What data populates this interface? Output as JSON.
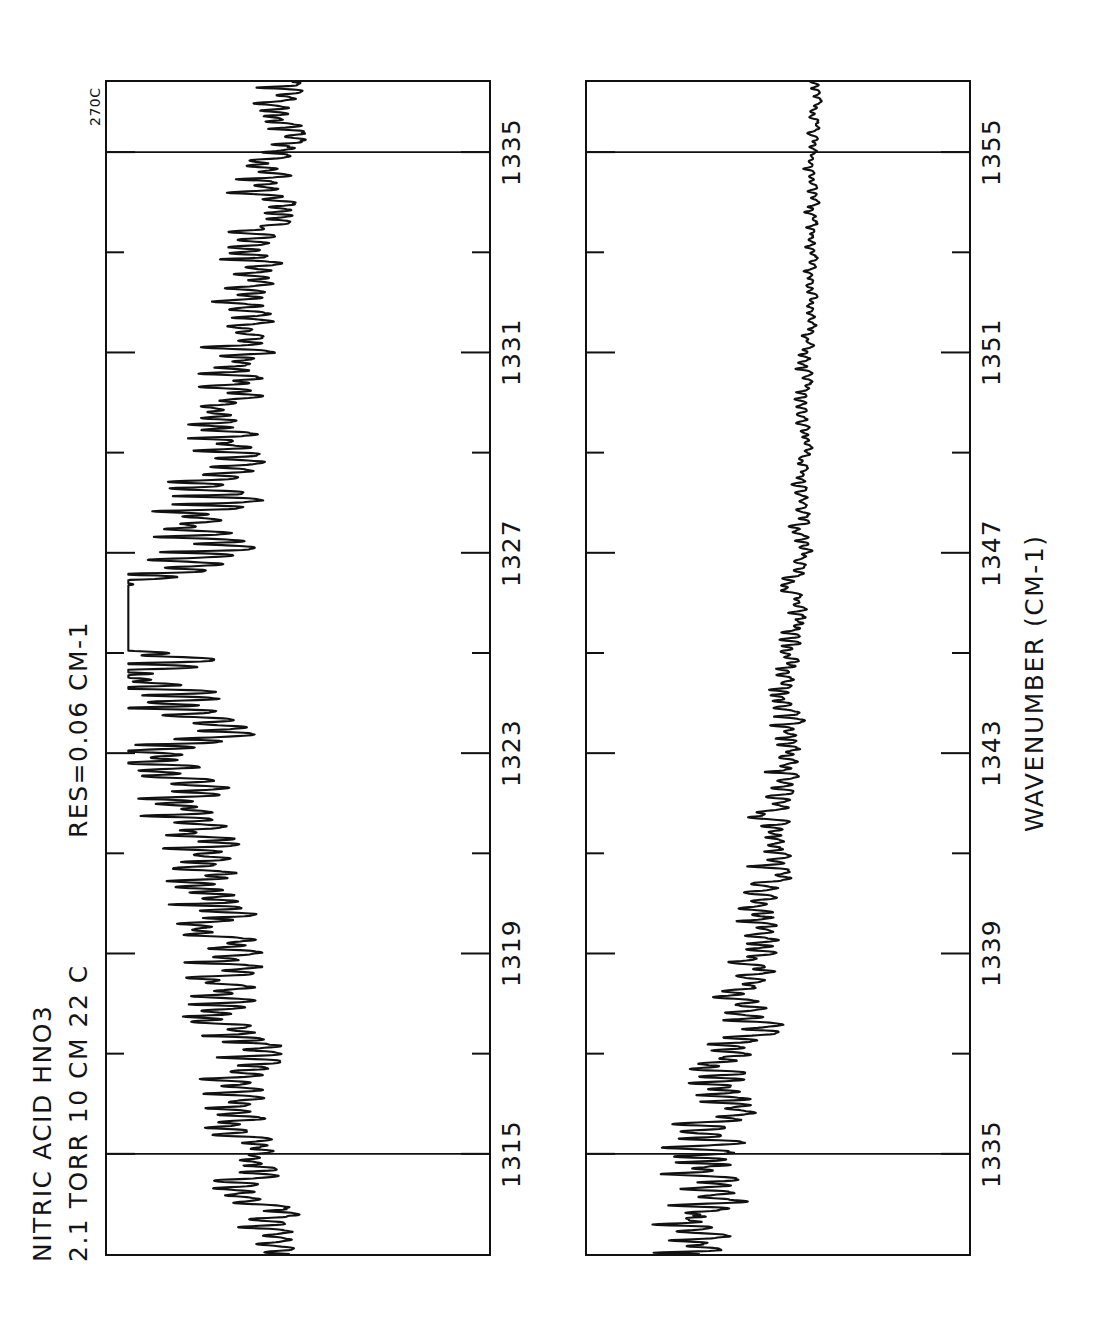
{
  "figure": {
    "header_line1": "NITRIC ACID  HNO3",
    "header_line2": "2.1 TORR  10 CM  22 C",
    "resolution_label": "RES=0.06 CM-1",
    "corner_label": "270C",
    "axis_title": "WAVENUMBER  (CM-1)",
    "ink_color": "#111111",
    "background_color": "#ffffff"
  },
  "chart_data": {
    "type": "line",
    "title": "NITRIC ACID  HNO3",
    "subtitle": "2.1 TORR  10 CM  22 C",
    "annotations": [
      "RES=0.06 CM-1",
      "270C"
    ],
    "xlabel": "WAVENUMBER  (CM-1)",
    "ylabel": "TRANSMITTANCE",
    "grid": true,
    "legend": "none",
    "orientation": "x-axis-vertical-rotated-90",
    "panels": [
      {
        "name": "upper-panel",
        "xlim": [
          1313.0,
          1336.4
        ],
        "major_ticks": [
          1315,
          1319,
          1323,
          1327,
          1331,
          1335
        ],
        "minor_ticks": [
          1317,
          1321,
          1325,
          1329,
          1333
        ],
        "tick_labels": [
          "1315",
          "1319",
          "1323",
          "1327",
          "1331",
          "1335"
        ],
        "gridlines": [
          1315,
          1335
        ],
        "ylim": [
          0,
          1
        ],
        "baseline": 1.0,
        "band_center": 1325.8,
        "band_description": "Strong Q-branch of the HNO3 nu4 band at 1325.7 cm-1 with dense P and R branch rotational structure",
        "max_absorption": 0.92,
        "series": [
          {
            "name": "transmittance",
            "feature_regions": [
              {
                "range": [
                  1313.0,
                  1320.0
                ],
                "depth": 0.55,
                "line_density": "high"
              },
              {
                "range": [
                  1320.0,
                  1324.5
                ],
                "depth": 0.6,
                "line_density": "high"
              },
              {
                "range": [
                  1324.5,
                  1326.6
                ],
                "depth": 0.92,
                "line_density": "q-branch"
              },
              {
                "range": [
                  1326.6,
                  1331.0
                ],
                "depth": 0.5,
                "line_density": "high"
              },
              {
                "range": [
                  1331.0,
                  1336.4
                ],
                "depth": 0.42,
                "line_density": "high"
              }
            ]
          }
        ]
      },
      {
        "name": "lower-panel",
        "xlim": [
          1333.0,
          1356.4
        ],
        "major_ticks": [
          1335,
          1339,
          1343,
          1347,
          1351,
          1355
        ],
        "minor_ticks": [
          1337,
          1341,
          1345,
          1349,
          1353
        ],
        "tick_labels": [
          "1335",
          "1339",
          "1343",
          "1347",
          "1351",
          "1355"
        ],
        "gridlines": [
          1335,
          1355
        ],
        "ylim": [
          0,
          1
        ],
        "baseline": 1.0,
        "band_description": "R-branch tail of the HNO3 nu4 band, absorption decreasing monotonically toward higher wavenumber",
        "max_absorption": 0.46,
        "series": [
          {
            "name": "transmittance",
            "feature_regions": [
              {
                "range": [
                  1333.0,
                  1337.0
                ],
                "depth": 0.46,
                "line_density": "high"
              },
              {
                "range": [
                  1337.0,
                  1341.0
                ],
                "depth": 0.4,
                "line_density": "high"
              },
              {
                "range": [
                  1341.0,
                  1345.0
                ],
                "depth": 0.28,
                "line_density": "medium"
              },
              {
                "range": [
                  1345.0,
                  1349.0
                ],
                "depth": 0.18,
                "line_density": "medium"
              },
              {
                "range": [
                  1349.0,
                  1353.0
                ],
                "depth": 0.1,
                "line_density": "low"
              },
              {
                "range": [
                  1353.0,
                  1356.4
                ],
                "depth": 0.05,
                "line_density": "low"
              }
            ]
          }
        ]
      }
    ]
  }
}
